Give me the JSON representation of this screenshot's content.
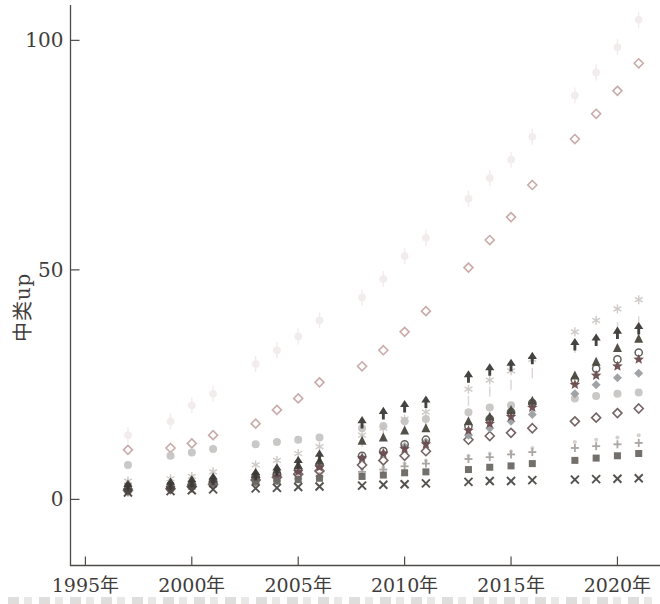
{
  "figure": {
    "ylabel": "中类up",
    "background": "#ffffff",
    "axis_color": "#4e4b49",
    "tick_label_color": "#3f3d3c"
  },
  "chart_data": {
    "type": "scatter",
    "title": "",
    "xlabel": "",
    "ylabel": "中类up",
    "grid": false,
    "legend": "none",
    "xlim": [
      1994.3,
      2022.0
    ],
    "ylim": [
      -14.4,
      107.7
    ],
    "x_tick_values": [
      1995,
      2000,
      2005,
      2010,
      2015,
      2020
    ],
    "x_tick_labels": [
      "1995年",
      "2000年",
      "2005年",
      "2010年",
      "2015年",
      "2020年"
    ],
    "y_tick_values": [
      0,
      50,
      100
    ],
    "y_tick_labels": [
      "0",
      "50",
      "100"
    ],
    "x": [
      1997,
      1999,
      2000,
      2001,
      2003,
      2004,
      2005,
      2006,
      2008,
      2009,
      2010,
      2011,
      2013,
      2014,
      2015,
      2016,
      2018,
      2019,
      2020,
      2021
    ],
    "series": [
      {
        "name": "ghost-circle",
        "marker": "circle-errorbar",
        "color": "#e7dddb",
        "size": 8,
        "opacity": 0.5,
        "values": [
          14,
          17,
          20.5,
          23,
          29.5,
          32.5,
          35.5,
          39,
          44,
          48,
          53,
          57,
          65.5,
          70,
          74,
          79,
          88,
          93,
          98.5,
          104.5
        ]
      },
      {
        "name": "open-diamond-salmon",
        "marker": "diamond-open",
        "color": "#c4a3a1",
        "size": 9,
        "opacity": 0.9,
        "values": [
          10.8,
          11.2,
          12.2,
          14,
          16.5,
          19.5,
          22,
          25.5,
          29,
          32.5,
          36.5,
          41,
          50.5,
          56.5,
          61.5,
          68.5,
          78.5,
          84,
          89,
          95
        ]
      },
      {
        "name": "asterisk-light",
        "marker": "asterisk",
        "color": "#c6c1bd",
        "size": 8,
        "opacity": 0.85,
        "values": [
          4,
          4.5,
          5,
          6,
          7.5,
          8.5,
          10,
          11.5,
          14,
          15.5,
          17.5,
          19,
          24,
          26,
          28,
          30.5,
          36.5,
          39,
          41.5,
          43.5
        ]
      },
      {
        "name": "vline-light",
        "marker": "vline",
        "color": "#d6cecb",
        "size": 10,
        "opacity": 0.85,
        "values": [
          3.5,
          4,
          4.5,
          5.5,
          6.5,
          7.5,
          9,
          10,
          12.5,
          14,
          16,
          17,
          21.5,
          23.5,
          25,
          27.5,
          33,
          35,
          37.5,
          38.8
        ]
      },
      {
        "name": "dot-light",
        "marker": "dot",
        "color": "#d2ccc8",
        "size": 4,
        "opacity": 0.9,
        "values": [
          1.8,
          2.2,
          2.6,
          3,
          3.8,
          4.2,
          4.8,
          5.5,
          6.5,
          7,
          7.8,
          8.5,
          9.5,
          10,
          10.5,
          11.2,
          12.5,
          13,
          13.5,
          14
        ]
      },
      {
        "name": "circle-light",
        "marker": "circle",
        "color": "#c5c3c0",
        "size": 8,
        "opacity": 0.9,
        "values": [
          7.5,
          9.5,
          10.2,
          11,
          12,
          12.5,
          13,
          13.5,
          15.5,
          16,
          17,
          17.5,
          19,
          20,
          20.5,
          21,
          22,
          22.5,
          23,
          23.3
        ]
      },
      {
        "name": "plus-gray",
        "marker": "plus",
        "color": "#a5a19d",
        "size": 8,
        "opacity": 0.95,
        "values": [
          1.5,
          2,
          2.3,
          2.8,
          3.5,
          4,
          4.5,
          5,
          6,
          6.5,
          7.2,
          7.8,
          8.8,
          9.2,
          9.8,
          10.3,
          11.2,
          11.6,
          12,
          12.3
        ]
      },
      {
        "name": "open-diamond-maroon",
        "marker": "diamond-open",
        "color": "#6f5b5c",
        "size": 9,
        "opacity": 0.95,
        "values": [
          2,
          2.3,
          2.8,
          3.3,
          4.2,
          4.8,
          5.5,
          6.2,
          7.5,
          8.5,
          9.5,
          10.5,
          13,
          13.8,
          14.5,
          15.5,
          17,
          17.8,
          18.8,
          19.8
        ]
      },
      {
        "name": "diamond-gray",
        "marker": "diamond",
        "color": "#9da0a3",
        "size": 9,
        "opacity": 0.95,
        "values": [
          2,
          2.5,
          3,
          3.8,
          4.8,
          5.5,
          6.5,
          7.5,
          9,
          10,
          11.5,
          12.5,
          14,
          15.5,
          17,
          18.5,
          23,
          25,
          26.5,
          27.5
        ]
      },
      {
        "name": "circle-open-dark",
        "marker": "circle-open",
        "color": "#5d5855",
        "size": 8,
        "opacity": 0.95,
        "values": [
          2.2,
          2.7,
          3.2,
          4,
          5,
          5.5,
          6.5,
          7.5,
          9.5,
          10.5,
          12,
          13,
          16,
          17.5,
          19,
          21,
          26,
          28.5,
          30.5,
          32
        ]
      },
      {
        "name": "star-dark",
        "marker": "star",
        "color": "#6b4c4f",
        "size": 9,
        "opacity": 0.95,
        "values": [
          2,
          2.5,
          3,
          3.5,
          4.5,
          5,
          6,
          7,
          9,
          10,
          11,
          12,
          15,
          16.5,
          18,
          20,
          25,
          27,
          29,
          30.5
        ]
      },
      {
        "name": "square-dark",
        "marker": "square",
        "color": "#6c6965",
        "size": 7,
        "opacity": 0.95,
        "values": [
          2.8,
          3,
          3.2,
          3.5,
          3.8,
          4,
          4.3,
          4.6,
          5,
          5.3,
          5.8,
          6,
          6.5,
          7,
          7.3,
          7.8,
          8.5,
          9,
          9.5,
          10
        ]
      },
      {
        "name": "triangle-dark",
        "marker": "triangle",
        "color": "#4a473f",
        "size": 8,
        "opacity": 0.95,
        "values": [
          2.5,
          3,
          3.5,
          4.5,
          5.5,
          6.5,
          7.5,
          8.5,
          12.8,
          13.5,
          15,
          15.5,
          17,
          18,
          19.5,
          21.5,
          27,
          30,
          33,
          35
        ]
      },
      {
        "name": "caret-up-black",
        "marker": "caret-up",
        "color": "#3c3a37",
        "size": 8,
        "opacity": 0.95,
        "values": [
          2.6,
          3.1,
          3.6,
          4.2,
          5.2,
          6.2,
          7.8,
          9.2,
          16.5,
          18.5,
          20,
          21,
          26.5,
          28,
          29,
          30.5,
          33.5,
          34.5,
          36,
          37
        ]
      },
      {
        "name": "x-dark",
        "marker": "x",
        "color": "#4b4845",
        "size": 8,
        "opacity": 0.95,
        "values": [
          1.5,
          1.8,
          2,
          2.2,
          2.4,
          2.5,
          2.7,
          2.8,
          3,
          3.2,
          3.3,
          3.5,
          3.8,
          4,
          4,
          4.2,
          4.3,
          4.4,
          4.5,
          4.6
        ]
      }
    ]
  }
}
